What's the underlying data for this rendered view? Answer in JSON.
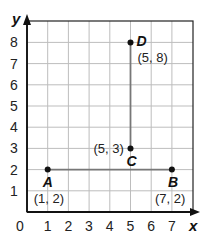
{
  "chart_data": {
    "type": "scatter",
    "title": "",
    "xlabel": "x",
    "ylabel": "y",
    "xlim": [
      0,
      8
    ],
    "ylim": [
      0,
      9
    ],
    "grid": true,
    "x_ticks": [
      "0",
      "1",
      "2",
      "3",
      "4",
      "5",
      "6",
      "7"
    ],
    "y_ticks": [
      "1",
      "2",
      "3",
      "4",
      "5",
      "6",
      "7",
      "8"
    ],
    "points": [
      {
        "name": "A",
        "x": 1,
        "y": 2,
        "coord_label": "(1, 2)"
      },
      {
        "name": "B",
        "x": 7,
        "y": 2,
        "coord_label": "(7, 2)"
      },
      {
        "name": "C",
        "x": 5,
        "y": 3,
        "coord_label": "(5, 3)"
      },
      {
        "name": "D",
        "x": 5,
        "y": 8,
        "coord_label": "(5, 8)"
      }
    ],
    "segments": [
      {
        "from": "A",
        "to": "B"
      },
      {
        "from": "C",
        "to": "D"
      }
    ]
  }
}
